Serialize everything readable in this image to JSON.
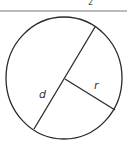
{
  "diagram": {
    "type": "circle-diameter-radius",
    "top_fragment_text": "2",
    "labels": {
      "diameter": "d",
      "radius": "r"
    },
    "colors": {
      "stroke": "#2a2a2a",
      "rule": "#777777",
      "background": "#ffffff"
    }
  }
}
